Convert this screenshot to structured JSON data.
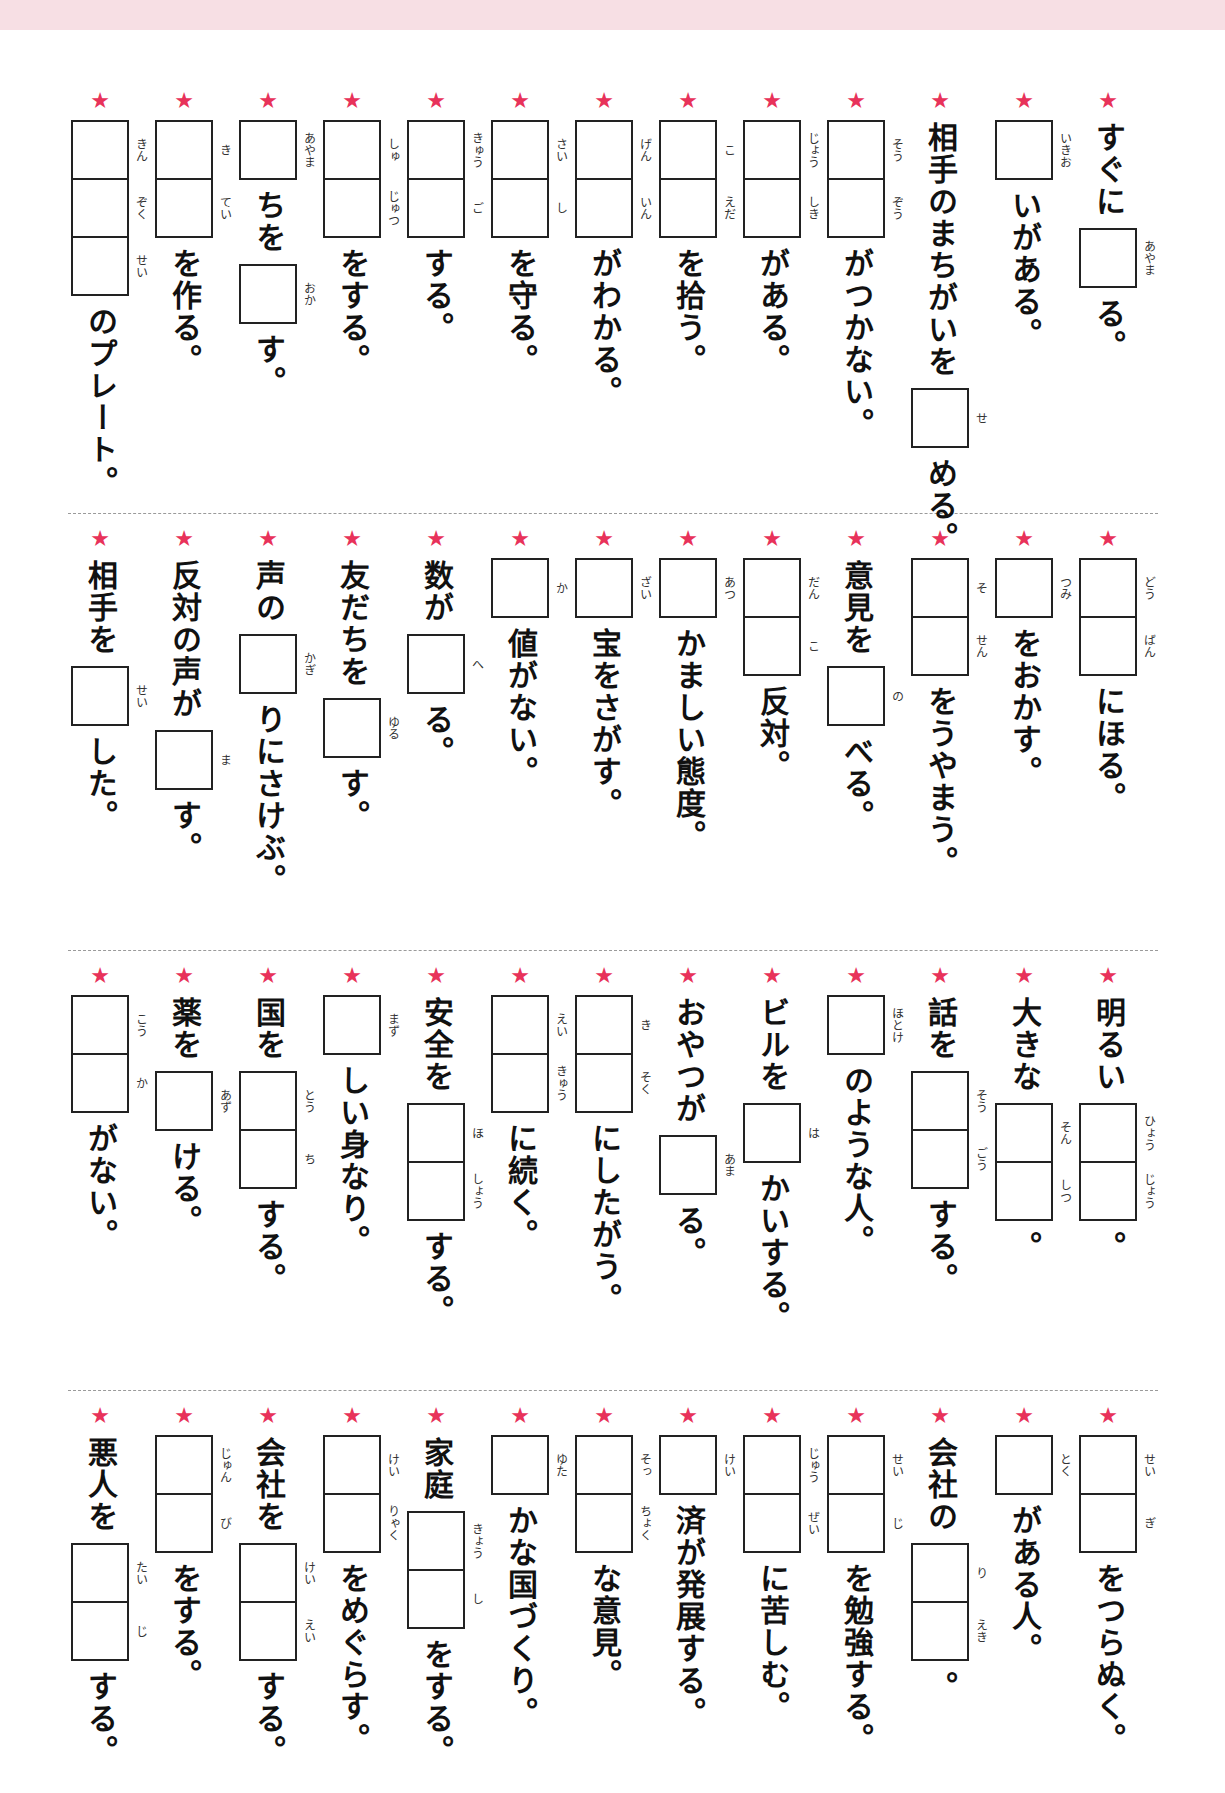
{
  "page": {
    "banner_color": "#f7dfe4",
    "star_color": "#e8325a",
    "star_glyph": "★"
  },
  "sections": [
    {
      "items": [
        {
          "segments": [
            {
              "t": "すぐに"
            },
            {
              "box": [
                "あやま"
              ]
            },
            {
              "t": "る。"
            }
          ]
        },
        {
          "segments": [
            {
              "box": [
                "いきお"
              ]
            },
            {
              "t": "いがある。"
            }
          ]
        },
        {
          "segments": [
            {
              "t": "相手のまちがいを"
            },
            {
              "box": [
                "せ"
              ]
            },
            {
              "t": "める。"
            }
          ]
        },
        {
          "segments": [
            {
              "box": [
                "そう",
                "ぞう"
              ]
            },
            {
              "t": "がつかない。"
            }
          ]
        },
        {
          "segments": [
            {
              "box": [
                "じょう",
                "しき"
              ]
            },
            {
              "t": "がある。"
            }
          ]
        },
        {
          "segments": [
            {
              "box": [
                "こ",
                "えだ"
              ]
            },
            {
              "t": "を拾う。"
            }
          ]
        },
        {
          "segments": [
            {
              "box": [
                "げん",
                "いん"
              ]
            },
            {
              "t": "がわかる。"
            }
          ]
        },
        {
          "segments": [
            {
              "box": [
                "さい",
                "し"
              ]
            },
            {
              "t": "を守る。"
            }
          ]
        },
        {
          "segments": [
            {
              "box": [
                "きゅう",
                "ご"
              ]
            },
            {
              "t": "する。"
            }
          ]
        },
        {
          "segments": [
            {
              "box": [
                "しゅ",
                "じゅつ"
              ]
            },
            {
              "t": "をする。"
            }
          ]
        },
        {
          "segments": [
            {
              "box": [
                "あやま"
              ]
            },
            {
              "t": "ちを"
            },
            {
              "box": [
                "おか"
              ]
            },
            {
              "t": "す。"
            }
          ]
        },
        {
          "segments": [
            {
              "box": [
                "き",
                "てい"
              ]
            },
            {
              "t": "を作る。"
            }
          ]
        },
        {
          "segments": [
            {
              "box": [
                "きん",
                "ぞく",
                "せい"
              ]
            },
            {
              "t": "のプレート。"
            }
          ]
        }
      ]
    },
    {
      "items": [
        {
          "segments": [
            {
              "box": [
                "どう",
                "ばん"
              ]
            },
            {
              "t": "にほる。"
            }
          ]
        },
        {
          "segments": [
            {
              "box": [
                "つみ"
              ]
            },
            {
              "t": "をおかす。"
            }
          ]
        },
        {
          "segments": [
            {
              "box": [
                "そ",
                "せん"
              ]
            },
            {
              "t": "をうやまう。"
            }
          ]
        },
        {
          "segments": [
            {
              "t": "意見を"
            },
            {
              "box": [
                "の"
              ]
            },
            {
              "t": "べる。"
            }
          ]
        },
        {
          "segments": [
            {
              "box": [
                "だん",
                "こ"
              ]
            },
            {
              "t": "反対。"
            }
          ]
        },
        {
          "segments": [
            {
              "box": [
                "あつ"
              ]
            },
            {
              "t": "かましい態度。"
            }
          ]
        },
        {
          "segments": [
            {
              "box": [
                "ざい"
              ]
            },
            {
              "t": "宝をさがす。",
              "ruby": "ほう"
            }
          ]
        },
        {
          "segments": [
            {
              "box": [
                "か"
              ]
            },
            {
              "t": "値がない。",
              "ruby": "ち"
            }
          ]
        },
        {
          "segments": [
            {
              "t": "数が"
            },
            {
              "box": [
                "へ"
              ]
            },
            {
              "t": "る。"
            }
          ]
        },
        {
          "segments": [
            {
              "t": "友だちを"
            },
            {
              "box": [
                "ゆる"
              ]
            },
            {
              "t": "す。"
            }
          ]
        },
        {
          "segments": [
            {
              "t": "声の"
            },
            {
              "box": [
                "かぎ"
              ]
            },
            {
              "t": "りにさけぶ。"
            }
          ]
        },
        {
          "segments": [
            {
              "t": "反対の声が"
            },
            {
              "box": [
                "ま"
              ]
            },
            {
              "t": "す。"
            }
          ]
        },
        {
          "segments": [
            {
              "t": "相手を"
            },
            {
              "box": [
                "せい"
              ]
            },
            {
              "t": "した。"
            }
          ]
        }
      ]
    },
    {
      "items": [
        {
          "segments": [
            {
              "t": "明るい"
            },
            {
              "box": [
                "ひょう",
                "じょう"
              ]
            },
            {
              "t": "。"
            }
          ]
        },
        {
          "segments": [
            {
              "t": "大きな"
            },
            {
              "box": [
                "そん",
                "しつ"
              ]
            },
            {
              "t": "。"
            }
          ]
        },
        {
          "segments": [
            {
              "t": "話を"
            },
            {
              "box": [
                "そう",
                "ごう"
              ]
            },
            {
              "t": "する。"
            }
          ]
        },
        {
          "segments": [
            {
              "box": [
                "ほとけ"
              ]
            },
            {
              "t": "のような人。"
            }
          ]
        },
        {
          "segments": [
            {
              "t": "ビルを"
            },
            {
              "box": [
                "は"
              ]
            },
            {
              "t": "かいする。"
            }
          ]
        },
        {
          "segments": [
            {
              "t": "おやつが"
            },
            {
              "box": [
                "あま"
              ]
            },
            {
              "t": "る。"
            }
          ]
        },
        {
          "segments": [
            {
              "box": [
                "き",
                "そく"
              ]
            },
            {
              "t": "にしたがう。"
            }
          ]
        },
        {
          "segments": [
            {
              "box": [
                "えい",
                "きゅう"
              ]
            },
            {
              "t": "に続く。"
            }
          ]
        },
        {
          "segments": [
            {
              "t": "安全を"
            },
            {
              "box": [
                "ほ",
                "しょう"
              ]
            },
            {
              "t": "する。"
            }
          ]
        },
        {
          "segments": [
            {
              "box": [
                "まず"
              ]
            },
            {
              "t": "しい身なり。"
            }
          ]
        },
        {
          "segments": [
            {
              "t": "国を"
            },
            {
              "box": [
                "とう",
                "ち"
              ]
            },
            {
              "t": "する。"
            }
          ]
        },
        {
          "segments": [
            {
              "t": "薬を"
            },
            {
              "box": [
                "あず"
              ]
            },
            {
              "t": "ける。"
            }
          ]
        },
        {
          "segments": [
            {
              "box": [
                "こう",
                "か"
              ]
            },
            {
              "t": "がない。"
            }
          ]
        }
      ]
    },
    {
      "items": [
        {
          "segments": [
            {
              "box": [
                "せい",
                "ぎ"
              ]
            },
            {
              "t": "をつらぬく。"
            }
          ]
        },
        {
          "segments": [
            {
              "box": [
                "とく"
              ]
            },
            {
              "t": "がある人。"
            }
          ]
        },
        {
          "segments": [
            {
              "t": "会社の"
            },
            {
              "box": [
                "り",
                "えき"
              ]
            },
            {
              "t": "。"
            }
          ]
        },
        {
          "segments": [
            {
              "box": [
                "せい",
                "じ"
              ]
            },
            {
              "t": "を勉強する。"
            }
          ]
        },
        {
          "segments": [
            {
              "box": [
                "じゅう",
                "ぜい"
              ]
            },
            {
              "t": "に苦しむ。"
            }
          ]
        },
        {
          "segments": [
            {
              "box": [
                "けい"
              ]
            },
            {
              "t": "済が発展する。",
              "ruby": "ざい・てん"
            }
          ]
        },
        {
          "segments": [
            {
              "box": [
                "そっ",
                "ちょく"
              ]
            },
            {
              "t": "な意見。"
            }
          ]
        },
        {
          "segments": [
            {
              "box": [
                "ゆた"
              ]
            },
            {
              "t": "かな国づくり。"
            }
          ]
        },
        {
          "segments": [
            {
              "t": "家庭"
            },
            {
              "box": [
                "きょう",
                "し"
              ]
            },
            {
              "t": "をする。"
            }
          ]
        },
        {
          "segments": [
            {
              "box": [
                "けい",
                "りゃく"
              ]
            },
            {
              "t": "をめぐらす。"
            }
          ]
        },
        {
          "segments": [
            {
              "t": "会社を"
            },
            {
              "box": [
                "けい",
                "えい"
              ]
            },
            {
              "t": "する。"
            }
          ]
        },
        {
          "segments": [
            {
              "box": [
                "じゅん",
                "び"
              ]
            },
            {
              "t": "をする。"
            }
          ]
        },
        {
          "segments": [
            {
              "t": "悪人を"
            },
            {
              "box": [
                "たい",
                "じ"
              ]
            },
            {
              "t": "する。"
            }
          ]
        }
      ]
    }
  ]
}
